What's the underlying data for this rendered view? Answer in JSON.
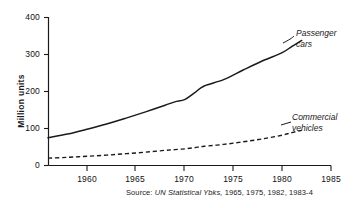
{
  "chart_data": {
    "type": "line",
    "title": "",
    "subtitle": "",
    "xlabel": "",
    "ylabel": "Million units",
    "xlim": [
      1956,
      1985
    ],
    "ylim": [
      0,
      400
    ],
    "grid": false,
    "legend_position": "inline-right",
    "xticks": [
      "1960",
      "1965",
      "1970",
      "1975",
      "1980",
      "1985"
    ],
    "xtick_values": [
      1960,
      1965,
      1970,
      1975,
      1980,
      1985
    ],
    "yticks": [
      "0",
      "100",
      "200",
      "300",
      "400"
    ],
    "ytick_values": [
      0,
      100,
      200,
      300,
      400
    ],
    "x": [
      1956,
      1958,
      1960,
      1962,
      1964,
      1966,
      1968,
      1969,
      1970,
      1971,
      1972,
      1974,
      1976,
      1978,
      1980,
      1981,
      1982
    ],
    "series": [
      {
        "name": "Passenger cars",
        "style": "solid",
        "color": "#1a1a1a",
        "values": [
          75,
          85,
          98,
          112,
          128,
          145,
          163,
          172,
          178,
          196,
          215,
          232,
          258,
          283,
          305,
          322,
          338
        ]
      },
      {
        "name": "Commercial vehicles",
        "style": "dashed",
        "color": "#1a1a1a",
        "values": [
          20,
          22,
          25,
          28,
          32,
          36,
          41,
          43,
          45,
          48,
          52,
          57,
          64,
          72,
          82,
          89,
          95
        ]
      }
    ],
    "annotations": [
      {
        "text": "Passenger cars",
        "anchor_x": 1982,
        "anchor_y": 338
      },
      {
        "text": "Commercial vehicles",
        "anchor_x": 1982,
        "anchor_y": 95
      }
    ],
    "source": {
      "prefix": "Source:",
      "emphasis": "UN Statistical Ybks,",
      "years": "1965, 1975, 1982, 1983-4",
      "full": "Source: UN Statistical Ybks, 1965, 1975, 1982, 1983-4"
    }
  },
  "axis": {
    "y_title": "Million units",
    "y_tick_0": "0",
    "y_tick_100": "100",
    "y_tick_200": "200",
    "y_tick_300": "300",
    "y_tick_400": "400",
    "x_tick_1960": "1960",
    "x_tick_1965": "1965",
    "x_tick_1970": "1970",
    "x_tick_1975": "1975",
    "x_tick_1980": "1980",
    "x_tick_1985": "1985"
  },
  "labels": {
    "passenger_line1": "Passenger",
    "passenger_line2": "cars",
    "commercial_line1": "Commercial",
    "commercial_line2": "vehicles"
  },
  "source_note": {
    "prefix": "Source:",
    "work": "UN Statistical Ybks,",
    "years": "1965, 1975, 1982, 1983-4"
  },
  "colors": {
    "ink": "#1a1a1a",
    "background": "#ffffff"
  }
}
